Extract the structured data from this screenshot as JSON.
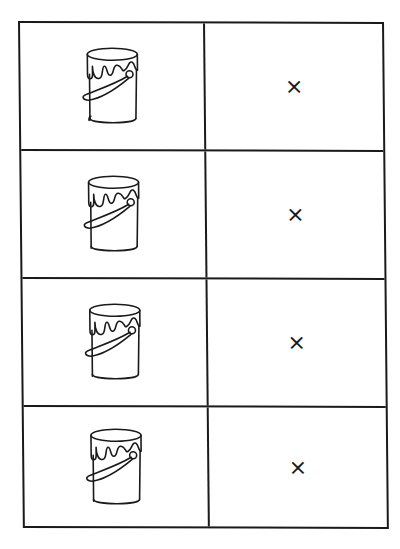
{
  "worksheet": {
    "rows": [
      {
        "image": "paint-can-icon",
        "mark": "×"
      },
      {
        "image": "paint-can-icon",
        "mark": "×"
      },
      {
        "image": "paint-can-icon",
        "mark": "×"
      },
      {
        "image": "paint-can-icon",
        "mark": "×"
      }
    ],
    "line_color": "#1a1a1a",
    "background": "#ffffff"
  }
}
